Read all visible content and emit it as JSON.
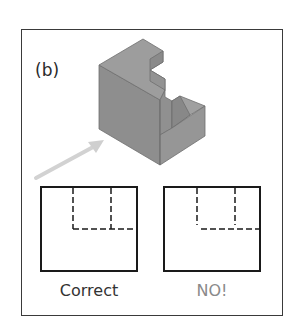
{
  "figure": {
    "panel_label": "(b)",
    "object": {
      "name": "stepped-block",
      "description": "Isometric solid block with stepped notch cut from top-right corner",
      "face_colors": {
        "top": "#9a9a9a",
        "left": "#8c8c8c",
        "right": "#959595"
      },
      "edge_color": "#6e6e6e"
    },
    "view_arrow": {
      "color": "#cfcfcf",
      "direction": "viewing direction toward front face"
    },
    "views": [
      {
        "id": "correct",
        "caption": "Correct",
        "caption_color": "#333333",
        "hidden_lines_joined": true
      },
      {
        "id": "wrong",
        "caption": "NO!",
        "caption_color": "#8a8a8a",
        "hidden_lines_joined": false
      }
    ],
    "line_color": "#1a1a1a"
  }
}
